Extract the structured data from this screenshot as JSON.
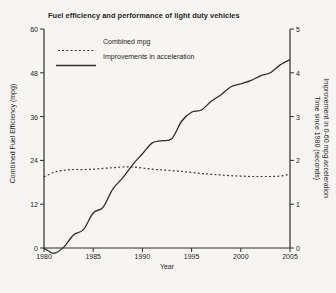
{
  "colors": {
    "background": "#f6f5f1",
    "line": "#2e2e2e",
    "text": "#262626"
  },
  "chart": {
    "title": "Fuel efficiency and performance of light duty vehicles",
    "legend": [
      {
        "label": "Combined mpg",
        "style": "dotted"
      },
      {
        "label": "Improvements in acceleration",
        "style": "solid"
      }
    ],
    "left_axis_label": "Combined Fuel Efficiency (mpg)",
    "right_axis_label_line1": "Improvement in 0-60 mpg acceleration",
    "right_axis_label_line2": "Time since 1980 (seconds)",
    "x_axis_label": "Year"
  },
  "chart_data": {
    "type": "line",
    "title": "Fuel efficiency and performance of light duty vehicles",
    "xlabel": "Year",
    "x_range": [
      1980,
      2005
    ],
    "x_ticks": [
      1980,
      1985,
      1990,
      1995,
      2000,
      2005
    ],
    "left_axis": {
      "label": "Combined Fuel Efficiency (mpg)",
      "range": [
        0,
        60
      ],
      "ticks": [
        0,
        12,
        24,
        36,
        48,
        60
      ]
    },
    "right_axis": {
      "label": "Improvement in 0-60 mpg acceleration Time since 1980 (seconds)",
      "range": [
        0,
        5
      ],
      "ticks": [
        0,
        1,
        2,
        3,
        4,
        5
      ]
    },
    "grid": false,
    "legend_position": "top-left-inside",
    "x": [
      1980,
      1981,
      1982,
      1983,
      1984,
      1985,
      1986,
      1987,
      1988,
      1989,
      1990,
      1991,
      1992,
      1993,
      1994,
      1995,
      1996,
      1997,
      1998,
      1999,
      2000,
      2001,
      2002,
      2003,
      2004,
      2005
    ],
    "series": [
      {
        "name": "Combined mpg",
        "axis": "left",
        "style": "dotted",
        "values": [
          19.5,
          20.7,
          21.3,
          21.5,
          21.5,
          21.6,
          21.8,
          22.0,
          22.2,
          22.2,
          21.9,
          21.6,
          21.4,
          21.2,
          21.0,
          20.7,
          20.4,
          20.2,
          20.0,
          19.8,
          19.7,
          19.6,
          19.6,
          19.6,
          19.7,
          20.2
        ]
      },
      {
        "name": "Improvements in acceleration",
        "axis": "right",
        "style": "solid",
        "values": [
          0,
          -0.12,
          0.02,
          0.3,
          0.42,
          0.8,
          0.93,
          1.35,
          1.6,
          1.9,
          2.15,
          2.4,
          2.45,
          2.5,
          2.9,
          3.1,
          3.15,
          3.35,
          3.5,
          3.68,
          3.75,
          3.82,
          3.93,
          4.0,
          4.18,
          4.3
        ]
      }
    ]
  }
}
